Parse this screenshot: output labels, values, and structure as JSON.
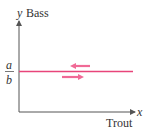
{
  "axes": {
    "y_var": "y",
    "y_label": "Bass",
    "x_var": "x",
    "x_label": "Trout"
  },
  "equilibrium": {
    "numerator": "a",
    "denominator": "b",
    "color": "#e8447a"
  },
  "arrows": [
    {
      "direction": "left",
      "position": "above-line"
    },
    {
      "direction": "right",
      "position": "below-line"
    }
  ],
  "colors": {
    "axis": "#555555",
    "line": "#e8447a",
    "arrow": "#f06a96"
  }
}
